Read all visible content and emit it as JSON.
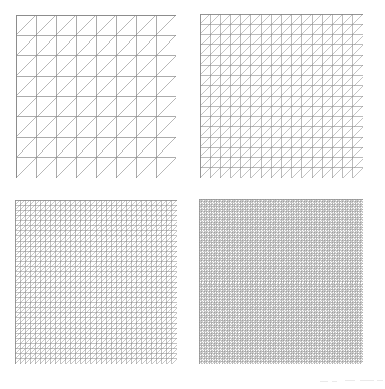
{
  "figure": {
    "panel_count": 4,
    "layout": "2x2 grid of square triangulated domains",
    "background_color": "#ffffff"
  },
  "chart_data": {
    "type": "diagram",
    "subtitle": "",
    "xlabel": "",
    "ylabel": "",
    "grid": true,
    "legend": "none",
    "domain": "unit square",
    "triangulation": "criss-cross right triangles, diagonals from lower-left to upper-right",
    "categories": [
      "Level 1",
      "Level 2",
      "Level 3",
      "Level 4"
    ],
    "values": [
      8,
      16,
      32,
      64
    ],
    "series": [
      {
        "name": "divisions per side",
        "values": [
          8,
          16,
          32,
          64
        ]
      },
      {
        "name": "square cells",
        "values": [
          64,
          256,
          1024,
          4096
        ]
      },
      {
        "name": "triangles",
        "values": [
          128,
          512,
          2048,
          8192
        ]
      },
      {
        "name": "vertices",
        "values": [
          81,
          289,
          1089,
          4225
        ]
      }
    ],
    "panels": [
      {
        "index": 0,
        "label": "top-left",
        "divisions": 8,
        "cells": 64,
        "triangles": 128,
        "vertices": 81,
        "grid_color": "#8a8a8a",
        "diagonal_color": "#9a9a9a",
        "border_color": "#8a8a8a",
        "line_width": 0.7,
        "diagonal_width": 0.7
      },
      {
        "index": 1,
        "label": "top-right",
        "divisions": 16,
        "cells": 256,
        "triangles": 512,
        "vertices": 289,
        "grid_color": "#8d8d8d",
        "diagonal_color": "#9d9d9d",
        "border_color": "#8a8a8a",
        "line_width": 0.6,
        "diagonal_width": 0.6
      },
      {
        "index": 2,
        "label": "bottom-left",
        "divisions": 32,
        "cells": 1024,
        "triangles": 2048,
        "vertices": 1089,
        "grid_color": "#8f8f8f",
        "diagonal_color": "#9f9f9f",
        "border_color": "#8c8c8c",
        "line_width": 0.55,
        "diagonal_width": 0.55
      },
      {
        "index": 3,
        "label": "bottom-right",
        "divisions": 64,
        "cells": 4096,
        "triangles": 8192,
        "vertices": 4225,
        "grid_color": "#8f8f8f",
        "diagonal_color": "#9a9a9a",
        "border_color": "#909090",
        "line_width": 0.5,
        "diagonal_width": 0.5
      }
    ]
  },
  "artifacts": {
    "description": "faint scanner speckle marks along bottom right margin",
    "color": "#d8d8d8",
    "count": 5
  }
}
